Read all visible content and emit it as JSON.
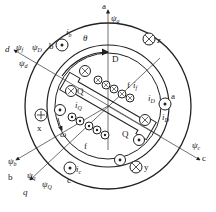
{
  "diagram": {
    "type": "synchronous machine cross-section with d-q axes",
    "axes": {
      "a": {
        "label": "a",
        "flux": "ψ",
        "flux_sub": "a"
      },
      "b": {
        "label": "b",
        "flux": "ψ",
        "flux_sub": "b"
      },
      "c": {
        "label": "c",
        "flux": "ψ",
        "flux_sub": "c"
      },
      "d": {
        "label": "d",
        "fluxes": [
          {
            "sym": "ψ",
            "sub": "f"
          },
          {
            "sym": "ψ",
            "sub": "D"
          },
          {
            "sym": "ψ",
            "sub": "d"
          }
        ]
      },
      "q": {
        "label": "q",
        "fluxes": [
          {
            "sym": "ψ",
            "sub": "q"
          },
          {
            "sym": "ψ",
            "sub": "Q"
          }
        ]
      }
    },
    "angles": {
      "theta": "θ",
      "omega": "ω"
    },
    "stator_coils": [
      {
        "name": "a",
        "current": "i",
        "current_sub": "D"
      },
      {
        "name": "b",
        "current": "i",
        "current_sub": "b"
      },
      {
        "name": "c",
        "current": "i",
        "current_sub": "c"
      },
      {
        "name": "x"
      },
      {
        "name": "y"
      },
      {
        "name": "z"
      }
    ],
    "rotor_windings": {
      "field": {
        "name": "f",
        "current": "i",
        "current_sub": "f"
      },
      "d_damper": {
        "name": "D",
        "current": "i",
        "current_sub": "D"
      },
      "q_damper": {
        "name": "Q",
        "current": "i",
        "current_sub": "Q"
      }
    },
    "labels": {
      "a": "a",
      "b": "b",
      "c": "c",
      "d": "d",
      "q": "q",
      "x": "x",
      "y": "y",
      "z": "z",
      "f": "f",
      "D": "D",
      "Q": "Q",
      "psi": "ψ",
      "theta": "θ",
      "omega": "ω",
      "i": "i",
      "sub_a": "a",
      "sub_b": "b",
      "sub_c": "c",
      "sub_d": "d",
      "sub_q": "q",
      "sub_f": "f",
      "sub_D": "D",
      "sub_Q": "Q"
    }
  }
}
